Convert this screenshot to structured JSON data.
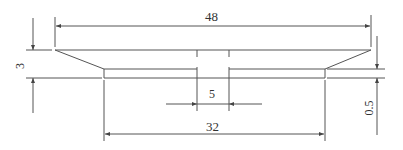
{
  "diagram": {
    "type": "technical-drawing",
    "line_color": "#555555",
    "dimensions": {
      "overall_width": {
        "label": "48",
        "orientation": "horizontal"
      },
      "hub_width": {
        "label": "32",
        "orientation": "horizontal"
      },
      "slot_width": {
        "label": "5",
        "orientation": "horizontal"
      },
      "rim_height": {
        "label": "3",
        "orientation": "vertical"
      },
      "step_height": {
        "label": "0.5",
        "orientation": "vertical"
      }
    }
  }
}
